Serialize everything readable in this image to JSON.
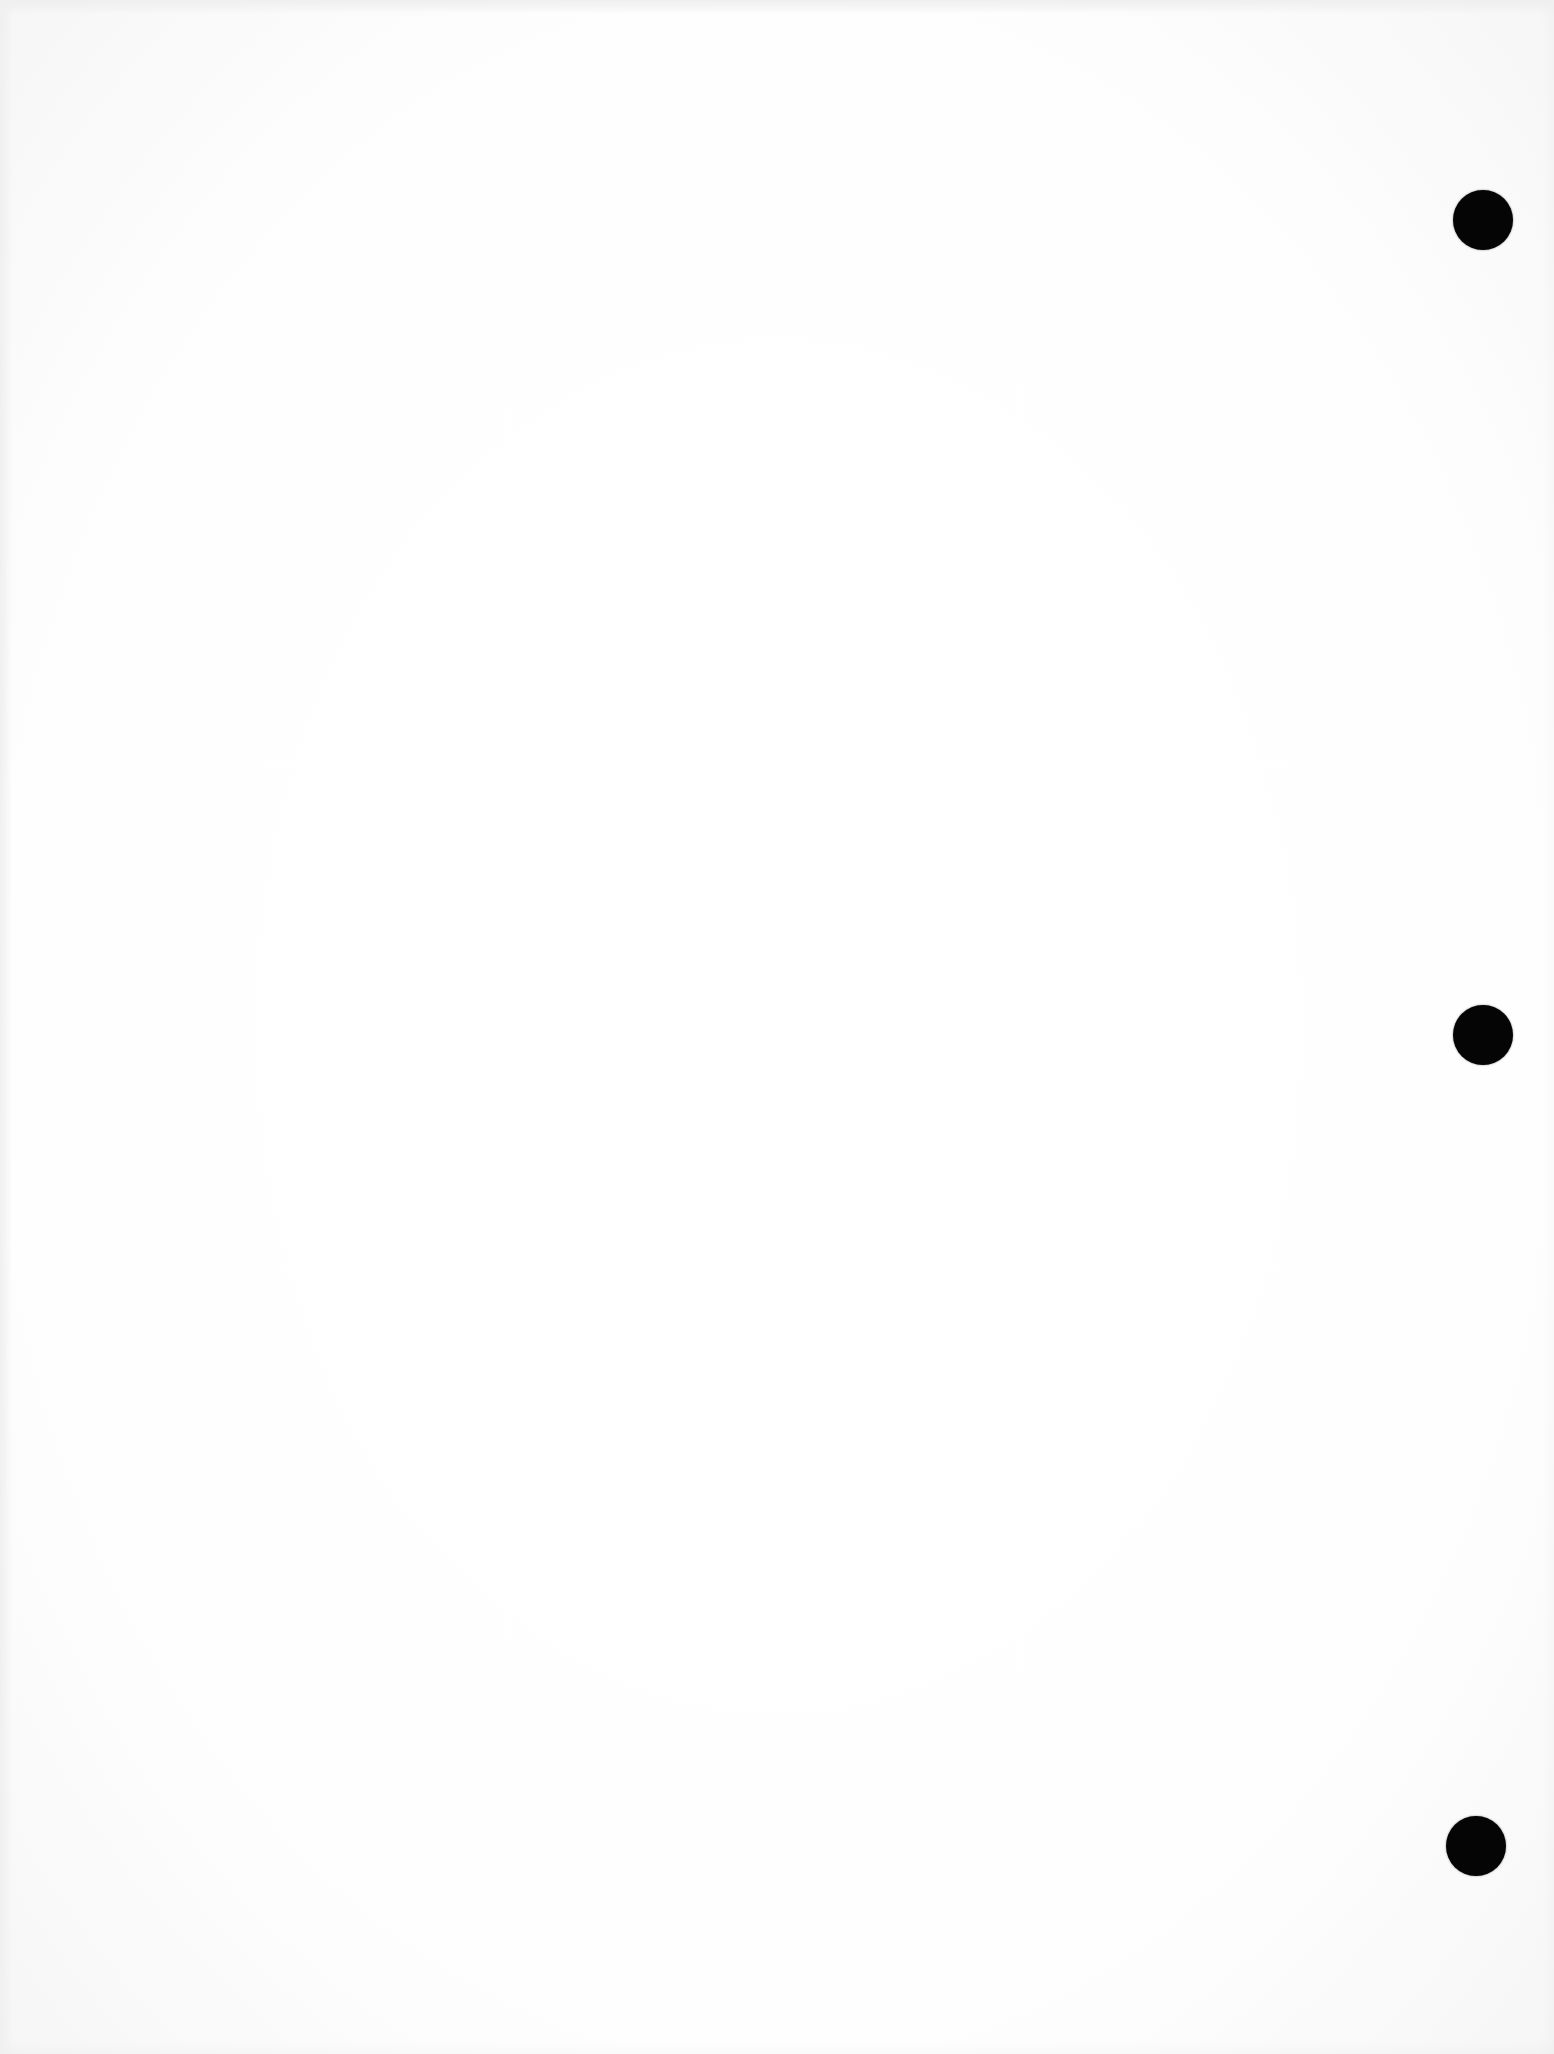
{
  "document": {
    "type": "blank scanned sheet",
    "background_color": "#ffffff",
    "bleed_through": {
      "title_text": "",
      "corner_text": "",
      "legible": false
    }
  },
  "punch_holes": [
    {
      "id": "top",
      "cx": 1483,
      "cy": 220,
      "radius": 30,
      "color": "#050505"
    },
    {
      "id": "middle",
      "cx": 1483,
      "cy": 1035,
      "radius": 30,
      "color": "#050505"
    },
    {
      "id": "bottom",
      "cx": 1476,
      "cy": 1846,
      "radius": 30,
      "color": "#050505"
    }
  ]
}
